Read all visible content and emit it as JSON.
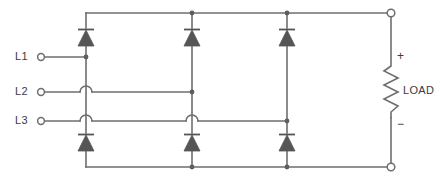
{
  "diagram": {
    "type": "schematic",
    "background_color": "#ffffff",
    "line_color": "#6e6e6e",
    "text_color": "#3b3b3b",
    "inputs": [
      {
        "id": "L1",
        "label": "L1",
        "terminal_x": 40,
        "terminal_y": 57,
        "line_y": 57
      },
      {
        "id": "L2",
        "label": "L2",
        "terminal_x": 40,
        "terminal_y": 92,
        "line_y": 92
      },
      {
        "id": "L3",
        "label": "L3",
        "terminal_x": 40,
        "terminal_y": 121,
        "line_y": 121
      }
    ],
    "rails": {
      "top_y": 13,
      "bottom_y": 167,
      "left_x": 86,
      "right_x": 391
    },
    "branches": [
      {
        "name": "branch-1",
        "x": 86,
        "phase": "L1"
      },
      {
        "name": "branch-2",
        "x": 192,
        "phase": "L2"
      },
      {
        "name": "branch-3",
        "x": 287,
        "phase": "L3"
      }
    ],
    "diodes": [
      {
        "name": "diode-upper-1",
        "x": 86,
        "y": 37,
        "orientation": "cathode-up"
      },
      {
        "name": "diode-upper-2",
        "x": 192,
        "y": 37,
        "orientation": "cathode-up"
      },
      {
        "name": "diode-upper-3",
        "x": 287,
        "y": 37,
        "orientation": "cathode-up"
      },
      {
        "name": "diode-lower-1",
        "x": 86,
        "y": 142,
        "orientation": "cathode-up"
      },
      {
        "name": "diode-lower-2",
        "x": 192,
        "y": 142,
        "orientation": "cathode-up"
      },
      {
        "name": "diode-lower-3",
        "x": 287,
        "y": 142,
        "orientation": "cathode-up"
      }
    ],
    "wire_hops": [
      {
        "name": "hop-l2-over-branch1",
        "x": 86,
        "y": 92
      },
      {
        "name": "hop-l3-over-branch1",
        "x": 86,
        "y": 121
      },
      {
        "name": "hop-l3-over-branch2",
        "x": 192,
        "y": 121
      }
    ],
    "junction_dots": [
      {
        "name": "junction-l1-branch1",
        "x": 86,
        "y": 57
      },
      {
        "name": "junction-l2-branch2",
        "x": 192,
        "y": 92
      },
      {
        "name": "junction-l3-branch3",
        "x": 287,
        "y": 121
      },
      {
        "name": "junction-top-branch2",
        "x": 192,
        "y": 13
      },
      {
        "name": "junction-top-branch3",
        "x": 287,
        "y": 13
      },
      {
        "name": "junction-bottom-branch2",
        "x": 192,
        "y": 167
      },
      {
        "name": "junction-bottom-branch3",
        "x": 287,
        "y": 167
      }
    ],
    "load": {
      "label": "LOAD",
      "plus_sign": "+",
      "minus_sign": "−",
      "x": 391,
      "top_y": 66,
      "bottom_y": 118
    },
    "output_terminals": [
      {
        "name": "output-positive",
        "x": 391,
        "y": 13,
        "polarity": "+"
      },
      {
        "name": "output-negative",
        "x": 391,
        "y": 167,
        "polarity": "−"
      }
    ]
  }
}
